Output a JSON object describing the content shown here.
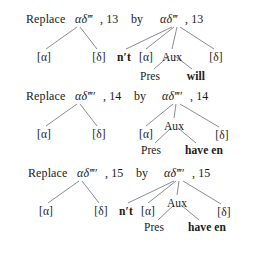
{
  "figure": {
    "type": "linguistic-tree-diagram",
    "background": "#ffffff",
    "ink": "#1a1a1a",
    "line_color": "#6b6f7a",
    "rules": [
      {
        "id": "rule-13",
        "header": {
          "replace_label": "Replace",
          "source_symbol": "αδ‴",
          "source_index": ", 13",
          "by_label": "by",
          "target_symbol": "αδ‴",
          "target_index": ", 13"
        },
        "left_tree": {
          "leaves": [
            "[α]",
            "[δ]"
          ]
        },
        "right_tree": {
          "leaves": [
            "n′t",
            "[α]",
            "Aux",
            "[δ]"
          ],
          "bold_leaves": [
            "n′t"
          ],
          "aux_children": [
            "Pres",
            "will"
          ],
          "aux_bold_children": [
            "will"
          ]
        }
      },
      {
        "id": "rule-14",
        "header": {
          "replace_label": "Replace",
          "source_symbol": "αδ‴′",
          "source_index": ", 14",
          "by_label": "by",
          "target_symbol": "αδ‴′",
          "target_index": ", 14"
        },
        "left_tree": {
          "leaves": [
            "[α]",
            "[δ]"
          ]
        },
        "right_tree": {
          "leaves": [
            "[α]",
            "Aux",
            "[δ]"
          ],
          "bold_leaves": [],
          "aux_children": [
            "Pres",
            "have en"
          ],
          "aux_bold_children": [
            "have en"
          ]
        }
      },
      {
        "id": "rule-15",
        "header": {
          "replace_label": "Replace",
          "source_symbol": "αδ‴′",
          "source_index": ", 15",
          "by_label": "by",
          "target_symbol": "αδ‴′",
          "target_index": ", 15"
        },
        "left_tree": {
          "leaves": [
            "[α]",
            "[δ]"
          ]
        },
        "right_tree": {
          "leaves": [
            "n′t",
            "[α]",
            "Aux",
            "[δ]"
          ],
          "bold_leaves": [
            "n′t"
          ],
          "aux_children": [
            "Pres",
            "have en"
          ],
          "aux_bold_children": [
            "have en"
          ]
        }
      }
    ]
  }
}
